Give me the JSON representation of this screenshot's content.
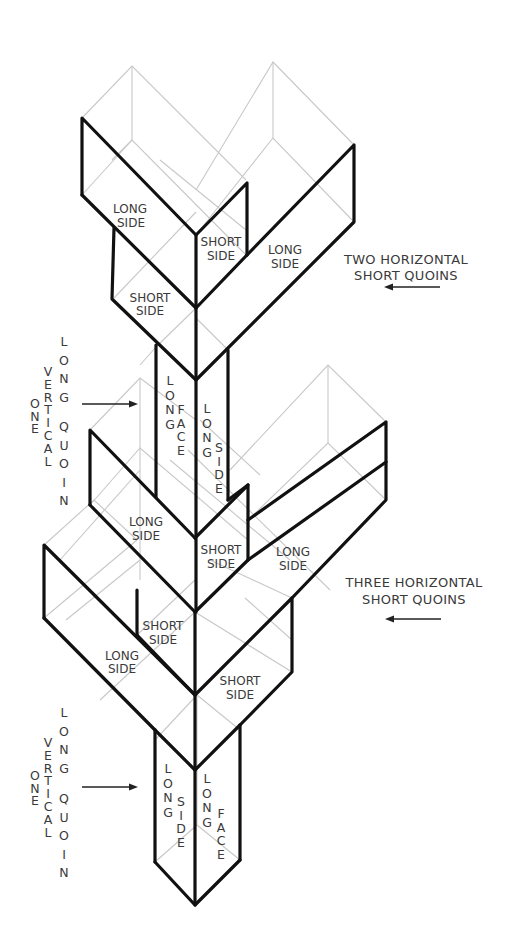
{
  "diagram": {
    "title_annotations": {
      "upper": {
        "line1": "TWO HORIZONTAL",
        "line2": "SHORT QUOINS",
        "arrow": "left"
      },
      "lower": {
        "line1": "THREE HORIZONTAL",
        "line2": "SHORT QUOINS",
        "arrow": "left"
      }
    },
    "vertical_annotations": {
      "upper": {
        "word1": "ONE",
        "word2": "VERTICAL",
        "word3": "LONG",
        "word4": "QUOIN",
        "arrow": "right"
      },
      "lower": {
        "word1": "ONE",
        "word2": "VERTICAL",
        "word3": "LONG",
        "word4": "QUOIN",
        "arrow": "right"
      }
    },
    "labels": {
      "upper_tier": {
        "left_long": [
          "LONG",
          "SIDE"
        ],
        "center_short": [
          "SHORT",
          "SIDE"
        ],
        "right_long": [
          "LONG",
          "SIDE"
        ],
        "left_short": [
          "SHORT",
          "SIDE"
        ]
      },
      "upper_shaft": {
        "left_face": {
          "word1": "LONG",
          "word2": "FACE"
        },
        "right_face": {
          "word1": "LONG",
          "word2": "SIDE"
        }
      },
      "middle_tier": {
        "left_long": [
          "LONG",
          "SIDE"
        ],
        "center_short": [
          "SHORT",
          "SIDE"
        ],
        "right_long": [
          "LONG",
          "SIDE"
        ]
      },
      "lower_tier": {
        "center_short": [
          "SHORT",
          "SIDE"
        ],
        "left_long": [
          "LONG",
          "SIDE"
        ],
        "right_short": [
          "SHORT",
          "SIDE"
        ]
      },
      "lower_shaft": {
        "left_face": {
          "word1": "LONG",
          "word2": "SIDE"
        },
        "right_face": {
          "word1": "LONG",
          "word2": "FACE"
        }
      }
    },
    "colors": {
      "outline": "#111111",
      "hidden_lines": "#c8c8c8",
      "text": "#3a3a3a",
      "background": "#ffffff"
    }
  }
}
